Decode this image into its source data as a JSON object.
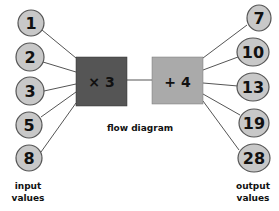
{
  "diagram": {
    "title": "flow diagram",
    "operations": [
      {
        "label": "× 3",
        "fill": "#555555"
      },
      {
        "label": "+ 4",
        "fill": "#aaaaaa"
      }
    ],
    "inputs": {
      "label_line1": "input",
      "label_line2": "values",
      "values": [
        "1",
        "2",
        "3",
        "5",
        "8"
      ]
    },
    "outputs": {
      "label_line1": "output",
      "label_line2": "values",
      "values": [
        "7",
        "10",
        "13",
        "19",
        "28"
      ]
    },
    "colors": {
      "node_fill": "#c8c8c8",
      "node_stroke": "#555555",
      "line": "#555555"
    }
  }
}
